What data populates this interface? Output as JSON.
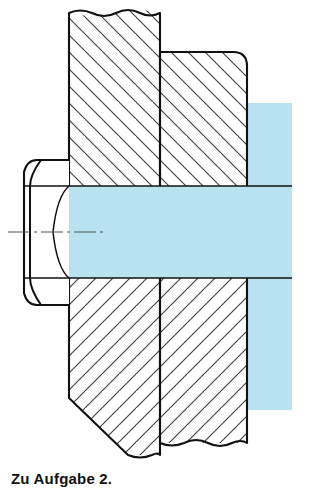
{
  "figure": {
    "caption": "Zu Aufgabe 2.",
    "title": "Zu Aufgabe 2.",
    "kind": "engineering-section-drawing",
    "colors": {
      "background": "#ffffff",
      "outline": "#111111",
      "hatch": "#3a3a3a",
      "shaft_highlight": "#b8e2ef",
      "centerline": "#555555",
      "caption_text": "#111111"
    },
    "parts": [
      {
        "name": "hex-head",
        "label": "Sechskantkopf",
        "description": "Hexagon bolt head shown in elevation with chamfer arcs",
        "hatched": false
      },
      {
        "name": "left-plate",
        "label": "Bauteil links",
        "description": "Left clamped plate in section with 45 degree hatching, chamfered lower left corner and freehand break lines top and bottom",
        "hatched": true,
        "hatch_direction": "mixed"
      },
      {
        "name": "right-plate",
        "label": "Bauteil rechts",
        "description": "Right clamped plate in section with 45 degree hatching and rounded upper right corner",
        "hatched": true,
        "hatch_direction": "mixed"
      },
      {
        "name": "bolt-shank",
        "label": "Schaft",
        "description": "Bolt shank drawn unsectioned and tinted light blue, running along the axis to the right",
        "hatched": false
      },
      {
        "name": "centerline",
        "label": "Mittellinie",
        "description": "Dash dot axis line of the bolt",
        "hatched": false
      }
    ],
    "geometry": {
      "axis_y": 232,
      "hex_head": {
        "left_x": 23,
        "right_x": 69,
        "top_y": 160,
        "bottom_y": 305,
        "flat_top_y": 185,
        "flat_bottom_y": 279
      },
      "left_plate": {
        "left_x": 69,
        "right_x": 160,
        "top_y": 12,
        "bottom_y": 462,
        "chamfer_start_y": 398,
        "chamfer_end_x": 128
      },
      "right_plate": {
        "left_x": 160,
        "right_x": 247,
        "top_y": 52,
        "bottom_y": 443,
        "corner_radius": 14
      },
      "shaft_band": {
        "left_x": 69,
        "right_x": 292,
        "top_y": 186,
        "bottom_y": 278
      },
      "shaft_block_right": {
        "left_x": 247,
        "right_x": 292,
        "top_y": 103,
        "bottom_y": 410
      }
    }
  }
}
